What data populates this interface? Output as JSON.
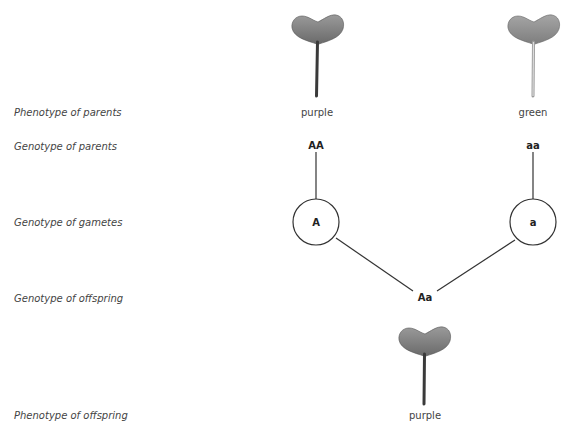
{
  "row_labels": {
    "phenotype_parents": "Phenotype of parents",
    "genotype_parents": "Genotype of parents",
    "genotype_gametes": "Genotype of gametes",
    "genotype_offspring": "Genotype of offspring",
    "phenotype_offspring": "Phenotype of offspring"
  },
  "parents": [
    {
      "phenotype": "purple",
      "genotype": "AA",
      "gamete": "A",
      "stem_color": "#3a3a3a",
      "leaf_color": "#7a7a7a"
    },
    {
      "phenotype": "green",
      "genotype": "aa",
      "gamete": "a",
      "stem_color": "#c8c8c8",
      "leaf_color": "#8a8a8a"
    }
  ],
  "offspring": {
    "genotype": "Aa",
    "phenotype": "purple",
    "stem_color": "#3a3a3a",
    "leaf_color": "#7a7a7a"
  }
}
